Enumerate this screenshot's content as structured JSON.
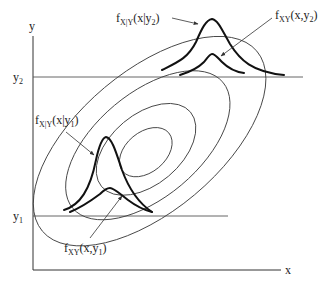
{
  "diagram": {
    "type": "bivariate-density-contours",
    "axes": {
      "x_label": "x",
      "y_label": "y"
    },
    "levels": [
      {
        "id": "y1",
        "label_base": "y",
        "label_sub": "1"
      },
      {
        "id": "y2",
        "label_base": "y",
        "label_sub": "2"
      }
    ],
    "annotations": {
      "cond_y2": {
        "f": "f",
        "sub": "X|Y",
        "args_pre": "(x|y",
        "args_sub": "2",
        "args_post": ")"
      },
      "joint_y2": {
        "f": "f",
        "sub": "XY",
        "args_pre": "(x,y",
        "args_sub": "2",
        "args_post": ")"
      },
      "cond_y1": {
        "f": "f",
        "sub": "X|Y",
        "args_pre": "(x|y",
        "args_sub": "1",
        "args_post": ")"
      },
      "joint_y1": {
        "f": "f",
        "sub": "XY",
        "args_pre": "(x,y",
        "args_sub": "1",
        "args_post": ")"
      }
    },
    "contour_count": 4
  }
}
